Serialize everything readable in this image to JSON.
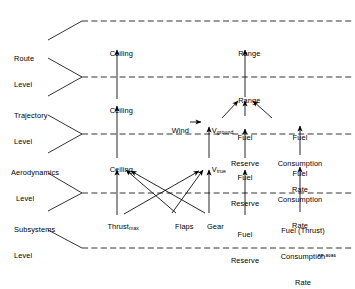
{
  "figure": {
    "id_tag": "FP-8086"
  },
  "levels": [
    {
      "name": "route",
      "line1": "Route",
      "line2": "Level"
    },
    {
      "name": "trajectory",
      "line1": "Trajectory",
      "line2": "Level"
    },
    {
      "name": "aerodynamics",
      "line1": "Aerodynamics",
      "line2": "Level"
    },
    {
      "name": "subsystems",
      "line1": "Subsystems",
      "line2": "Level"
    }
  ],
  "nodes": {
    "route": [
      {
        "name": "ceiling-route",
        "label": "Ceiling"
      },
      {
        "name": "range-route",
        "label": "Range"
      }
    ],
    "trajectory": [
      {
        "name": "ceiling-trajectory",
        "label": "Ceiling"
      },
      {
        "name": "wind",
        "label": "Wind"
      },
      {
        "name": "v-ground",
        "label": "V",
        "sub": "ground"
      },
      {
        "name": "range-trajectory",
        "label": "Range"
      },
      {
        "name": "fuel-reserve-trajectory",
        "l1": "Fuel",
        "l2": "Reserve"
      },
      {
        "name": "fuel-consumption-rate-trajectory",
        "l1": "Fuel",
        "l2": "Consumption",
        "l3": "Rate"
      }
    ],
    "aerodynamics": [
      {
        "name": "ceiling-aerodynamics",
        "label": "Ceiling"
      },
      {
        "name": "v-true",
        "label": "V",
        "sub": "true"
      },
      {
        "name": "fuel-reserve-aerodynamics",
        "l1": "Fuel",
        "l2": "Reserve"
      },
      {
        "name": "fuel-consumption-rate-aerodynamics",
        "l1": "Fuel",
        "l2": "Consumption",
        "l3": "Rate"
      }
    ],
    "subsystems": [
      {
        "name": "thrust-max",
        "label": "Thrust",
        "sub": "max"
      },
      {
        "name": "flaps",
        "label": "Flaps"
      },
      {
        "name": "gear",
        "label": "Gear"
      },
      {
        "name": "fuel-reserve-subsystems",
        "l1": "Fuel",
        "l2": "Reserve"
      },
      {
        "name": "fuel-thrust-consumption-rate-subsystems",
        "l1": "Fuel (Thrust)",
        "l2": "Consumption",
        "l3": "Rate"
      }
    ]
  },
  "style": {
    "line_color": "#000000",
    "background": "#ffffff"
  }
}
